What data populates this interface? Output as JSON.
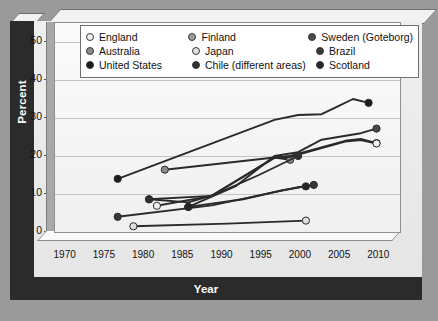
{
  "axes": {
    "ylabel": "Percent",
    "xlabel": "Year",
    "yticks": [
      "0",
      "10",
      "20",
      "30",
      "40",
      "50"
    ],
    "xticks": [
      "1970",
      "1975",
      "1980",
      "1985",
      "1990",
      "1995",
      "2000",
      "2005",
      "2010"
    ]
  },
  "legend": {
    "rows": [
      [
        {
          "label": "England",
          "color": "#f0f0f0"
        },
        {
          "label": "Finland",
          "color": "#9d9d9d"
        },
        {
          "label": "Sweden (Goteborg)",
          "color": "#4a4a4a"
        }
      ],
      [
        {
          "label": "Australia",
          "color": "#8a8a8a"
        },
        {
          "label": "Japan",
          "color": "#e0e0e0"
        },
        {
          "label": "Brazil",
          "color": "#383838"
        }
      ],
      [
        {
          "label": "United States",
          "color": "#1c1c1c"
        },
        {
          "label": "Chile (different areas)",
          "color": "#303030"
        },
        {
          "label": "Scotland",
          "color": "#262626"
        }
      ]
    ]
  },
  "chart_data": {
    "type": "line",
    "title": "",
    "xlabel": "Year",
    "ylabel": "Percent",
    "xlim": [
      1968,
      2012
    ],
    "ylim": [
      0,
      55
    ],
    "yticks": [
      0,
      10,
      20,
      30,
      40,
      50
    ],
    "xticks": [
      1970,
      1975,
      1980,
      1985,
      1990,
      1995,
      2000,
      2005,
      2010
    ],
    "grid": true,
    "legend_position": "top",
    "series": [
      {
        "name": "United States",
        "color": "#1c1c1c",
        "x": [
          1976,
          1996,
          1999,
          2002,
          2004,
          2006,
          2008
        ],
        "y": [
          14.0,
          29.5,
          30.8,
          31.0,
          33.0,
          35.0,
          34.0
        ]
      },
      {
        "name": "Australia",
        "color": "#8a8a8a",
        "x": [
          1982,
          1990,
          1996,
          1998
        ],
        "y": [
          16.4,
          18.2,
          19.6,
          19.0
        ]
      },
      {
        "name": "Finland",
        "color": "#9d9d9d",
        "x": [
          1980,
          1985,
          1988,
          1996,
          1998,
          2005,
          2007,
          2009
        ],
        "y": [
          8.6,
          7.8,
          9.6,
          19.6,
          20.0,
          24.0,
          24.5,
          23.4
        ]
      },
      {
        "name": "England",
        "color": "#f0f0f0",
        "x": [
          1981,
          1988,
          1996,
          1998,
          2005,
          2007,
          2009
        ],
        "y": [
          6.9,
          9.5,
          19.5,
          19.8,
          23.8,
          24.2,
          23.3
        ]
      },
      {
        "name": "Sweden (Goteborg)",
        "color": "#4a4a4a",
        "x": [
          1985,
          1991,
          1996,
          1999,
          2002,
          2007,
          2009
        ],
        "y": [
          6.6,
          12.0,
          20.0,
          21.0,
          24.3,
          26.0,
          27.2
        ]
      },
      {
        "name": "Brazil",
        "color": "#383838",
        "x": [
          1976,
          1988,
          1996,
          1999,
          2001
        ],
        "y": [
          4.0,
          7.0,
          10.5,
          11.8,
          12.4
        ]
      },
      {
        "name": "Scotland",
        "color": "#262626",
        "x": [
          1985,
          1992,
          1997,
          2000
        ],
        "y": [
          6.6,
          8.6,
          11.0,
          12.0
        ]
      },
      {
        "name": "Chile (different areas)",
        "color": "#303030",
        "x": [
          1980,
          1988,
          1994,
          1999
        ],
        "y": [
          8.6,
          9.5,
          15.0,
          20.0
        ]
      },
      {
        "name": "Japan",
        "color": "#e0e0e0",
        "x": [
          1978,
          1990,
          2000
        ],
        "y": [
          1.5,
          2.2,
          3.0
        ]
      }
    ]
  }
}
